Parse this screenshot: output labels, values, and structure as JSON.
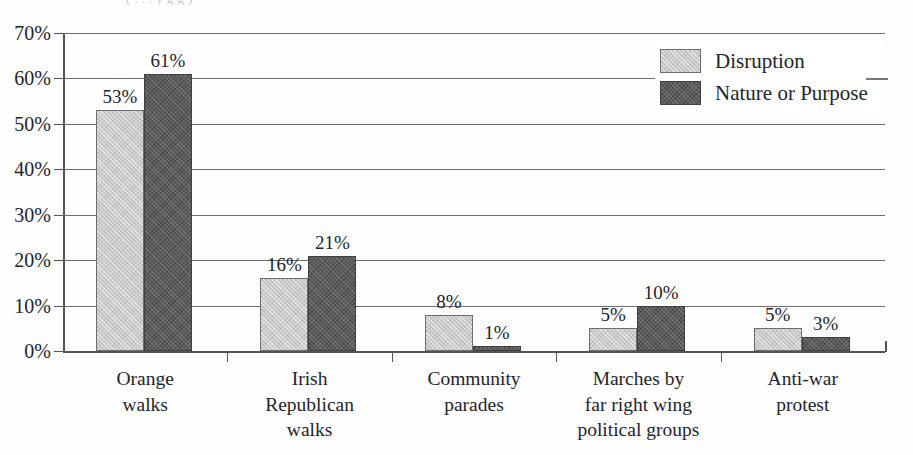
{
  "figure": {
    "caption_remnant": "(  . . .  y   g                                                          g   )",
    "background": "#ffffff"
  },
  "chart_data": {
    "type": "bar",
    "title": "",
    "subtitle": "",
    "xlabel": "",
    "ylabel": "",
    "categories": [
      "Orange\nwalks",
      "Irish\nRepublican\nwalks",
      "Community\nparades",
      "Marches by\nfar right wing\npolitical groups",
      "Anti-war\nprotest"
    ],
    "series": [
      {
        "name": "Disruption",
        "color": "#cacaca",
        "values": [
          53,
          16,
          8,
          5,
          5
        ],
        "value_labels": [
          "53%",
          "16%",
          "8%",
          "5%",
          "5%"
        ]
      },
      {
        "name": "Nature or Purpose",
        "color": "#5b5b5b",
        "values": [
          61,
          21,
          1,
          10,
          3
        ],
        "value_labels": [
          "61%",
          "21%",
          "1%",
          "10%",
          "3%"
        ]
      }
    ],
    "ylim": [
      0,
      70
    ],
    "ytick_values": [
      0,
      10,
      20,
      30,
      40,
      50,
      60,
      70
    ],
    "ytick_labels": [
      "0%",
      "10%",
      "20%",
      "30%",
      "40%",
      "50%",
      "60%",
      "70%"
    ],
    "grid": true,
    "grid_axis": "y",
    "legend_position": "top-right",
    "value_labels_shown": true
  },
  "legend": {
    "entries": [
      {
        "label": "Disruption",
        "swatch": "light-gray-swatch"
      },
      {
        "label": "Nature or Purpose",
        "swatch": "dark-gray-swatch"
      }
    ]
  }
}
